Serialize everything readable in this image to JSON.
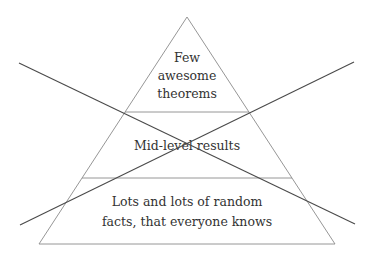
{
  "diagram": {
    "type": "pyramid",
    "crossed_out": true,
    "colors": {
      "background": "#ffffff",
      "outline": "#8a8a8a",
      "cross": "#4a4a4a",
      "text": "#333333"
    },
    "tiers": [
      {
        "level": "top",
        "lines": [
          "Few",
          "awesome",
          "theorems"
        ]
      },
      {
        "level": "middle",
        "lines": [
          "Mid-level results"
        ]
      },
      {
        "level": "bottom",
        "lines": [
          "Lots and lots of random",
          "facts, that everyone knows"
        ]
      }
    ]
  }
}
